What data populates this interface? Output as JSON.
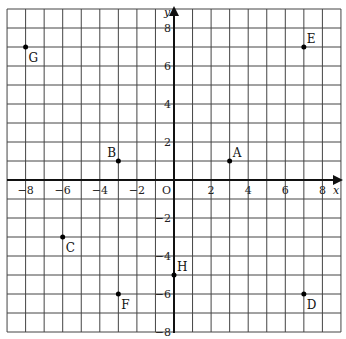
{
  "diagram": {
    "type": "coordinate-plane",
    "x_axis_label": "x",
    "y_axis_label": "y",
    "origin_label": "O",
    "x_range": [
      -9,
      9
    ],
    "y_range": [
      -8,
      9
    ],
    "x_tick_labels": [
      "-8",
      "-6",
      "-4",
      "-2",
      "2",
      "4",
      "6",
      "8"
    ],
    "y_tick_labels": [
      "8",
      "6",
      "4",
      "2",
      "-2",
      "-4",
      "-6",
      "-8"
    ],
    "points": [
      {
        "label": "A",
        "x": 3,
        "y": 1
      },
      {
        "label": "B",
        "x": -3,
        "y": 1
      },
      {
        "label": "C",
        "x": -6,
        "y": -3
      },
      {
        "label": "D",
        "x": 7,
        "y": -6
      },
      {
        "label": "E",
        "x": 7,
        "y": 7
      },
      {
        "label": "F",
        "x": -3,
        "y": -6
      },
      {
        "label": "G",
        "x": -8,
        "y": 7
      },
      {
        "label": "H",
        "x": 0,
        "y": -5
      }
    ]
  }
}
